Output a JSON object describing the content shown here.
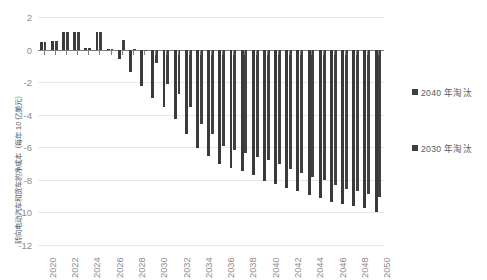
{
  "chart_data": {
    "type": "bar",
    "title": "",
    "xlabel": "",
    "ylabel": "转向电动汽车和货车的净成本（每年 10 亿美元）",
    "ylim": [
      -12,
      2
    ],
    "yticks": [
      2,
      0,
      -2,
      -4,
      -6,
      -8,
      -10,
      -12
    ],
    "ytick_labels": [
      "2",
      "0",
      "-2",
      "-4",
      "-6",
      "-8",
      "-10",
      "-12"
    ],
    "grid": true,
    "legend_position": "right",
    "categories": [
      "2020",
      "2021",
      "2022",
      "2023",
      "2024",
      "2025",
      "2026",
      "2027",
      "2028",
      "2029",
      "2030",
      "2031",
      "2032",
      "2033",
      "2034",
      "2035",
      "2036",
      "2037",
      "2038",
      "2039",
      "2040",
      "2041",
      "2042",
      "2043",
      "2044",
      "2045",
      "2046",
      "2047",
      "2048",
      "2049",
      "2050"
    ],
    "xtick_labels": [
      "2020",
      "2022",
      "2024",
      "2026",
      "2028",
      "2030",
      "2032",
      "2034",
      "2036",
      "2038",
      "2040",
      "2042",
      "2044",
      "2046",
      "2048",
      "2050"
    ],
    "series": [
      {
        "name": "2040 年淘汰",
        "color": "#404040",
        "values": [
          0.45,
          0.5,
          1.05,
          1.05,
          0.1,
          1.05,
          0.05,
          0.6,
          0.05,
          -0.05,
          -0.8,
          -2.1,
          -2.75,
          -3.55,
          -4.55,
          -5.2,
          -5.95,
          -6.15,
          -6.35,
          -6.6,
          -6.8,
          -7.05,
          -7.35,
          -7.6,
          -7.85,
          -8.0,
          -8.3,
          -8.55,
          -8.7,
          -8.85,
          -9.05
        ]
      },
      {
        "name": "2030 年淘汰",
        "color": "#3a3a3a",
        "values": [
          0.45,
          0.5,
          1.05,
          1.05,
          0.1,
          1.05,
          0.05,
          -0.55,
          -1.35,
          -2.25,
          -3.0,
          -3.5,
          -4.25,
          -5.2,
          -6.05,
          -6.55,
          -7.0,
          -7.25,
          -7.45,
          -7.7,
          -8.05,
          -8.25,
          -8.5,
          -8.7,
          -8.95,
          -9.1,
          -9.35,
          -9.5,
          -9.6,
          -9.7,
          -9.95
        ]
      }
    ]
  },
  "legend": {
    "items": [
      {
        "label": "2040 年淘汰",
        "color": "#404040"
      },
      {
        "label": "2030 年淘汰",
        "color": "#3a3a3a"
      }
    ]
  }
}
